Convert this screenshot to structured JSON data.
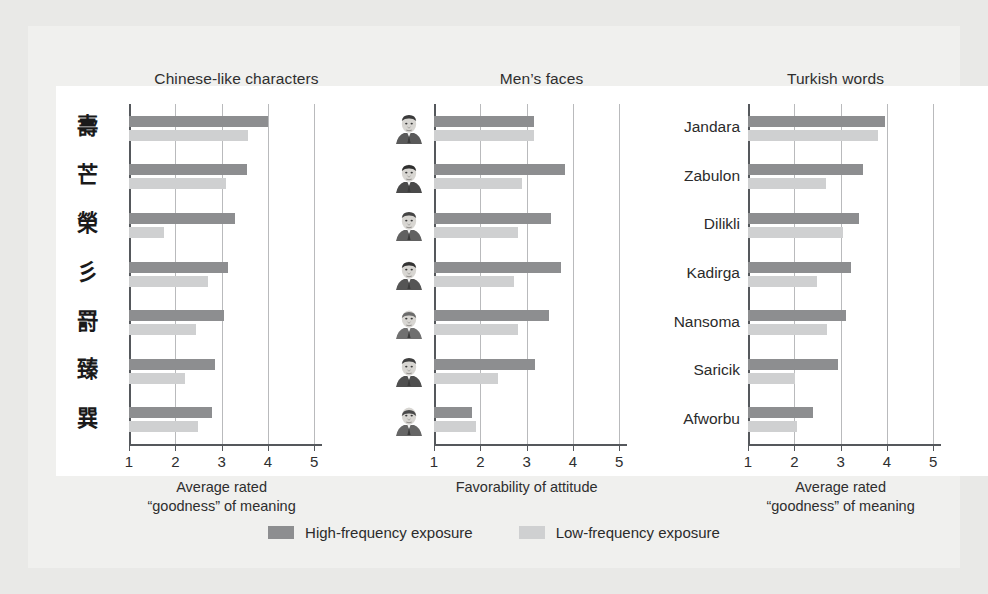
{
  "figure": {
    "background": "#e9e9e7",
    "card_background": "#ffffff",
    "colors": {
      "high_frequency": "#8d8e90",
      "low_frequency": "#cfd0d1",
      "axis": "#55585c",
      "gridline": "#b9babc",
      "text": "#2b2b2b"
    }
  },
  "legend": {
    "items": [
      {
        "label": "High-frequency exposure",
        "color": "#8d8e90",
        "key": "high"
      },
      {
        "label": "Low-frequency exposure",
        "color": "#cfd0d1",
        "key": "low"
      }
    ]
  },
  "chart_data": [
    {
      "type": "bar",
      "orientation": "horizontal",
      "title": "Chinese-like characters",
      "xlabel": "Average rated\n“goodness” of meaning",
      "ylabel": "",
      "xlim": [
        1,
        5
      ],
      "xticks": [
        1,
        2,
        3,
        4,
        5
      ],
      "ticklabels": [
        "1",
        "2",
        "3",
        "4",
        "5"
      ],
      "grid": true,
      "legend_position": "bottom",
      "category_type": "glyph",
      "categories": [
        "壽",
        "芒",
        "榮",
        "彡",
        "罸",
        "臻",
        "巽"
      ],
      "series": [
        {
          "name": "High-frequency exposure",
          "color": "#8d8e90",
          "values": [
            4.0,
            3.55,
            3.28,
            3.13,
            3.05,
            2.85,
            2.8
          ]
        },
        {
          "name": "Low-frequency exposure",
          "color": "#cfd0d1",
          "values": [
            3.57,
            3.1,
            1.75,
            2.7,
            2.45,
            2.2,
            2.5
          ]
        }
      ]
    },
    {
      "type": "bar",
      "orientation": "horizontal",
      "title": "Men’s faces",
      "xlabel": "Favorability of attitude",
      "ylabel": "",
      "xlim": [
        1,
        5
      ],
      "xticks": [
        1,
        2,
        3,
        4,
        5
      ],
      "ticklabels": [
        "1",
        "2",
        "3",
        "4",
        "5"
      ],
      "grid": true,
      "legend_position": "bottom",
      "category_type": "face",
      "categories": [
        "face-1",
        "face-2",
        "face-3",
        "face-4",
        "face-5",
        "face-6",
        "face-7"
      ],
      "series": [
        {
          "name": "High-frequency exposure",
          "color": "#8d8e90",
          "values": [
            3.15,
            3.82,
            3.53,
            3.75,
            3.48,
            3.18,
            1.82
          ]
        },
        {
          "name": "Low-frequency exposure",
          "color": "#cfd0d1",
          "values": [
            3.17,
            2.9,
            2.82,
            2.72,
            2.82,
            2.38,
            1.9
          ]
        }
      ]
    },
    {
      "type": "bar",
      "orientation": "horizontal",
      "title": "Turkish words",
      "xlabel": "Average rated\n“goodness” of meaning",
      "ylabel": "",
      "xlim": [
        1,
        5
      ],
      "xticks": [
        1,
        2,
        3,
        4,
        5
      ],
      "ticklabels": [
        "1",
        "2",
        "3",
        "4",
        "5"
      ],
      "grid": true,
      "legend_position": "bottom",
      "category_type": "text",
      "categories": [
        "Jandara",
        "Zabulon",
        "Dilikli",
        "Kadirga",
        "Nansoma",
        "Saricik",
        "Afworbu"
      ],
      "series": [
        {
          "name": "High-frequency exposure",
          "color": "#8d8e90",
          "values": [
            3.95,
            3.48,
            3.4,
            3.22,
            3.12,
            2.95,
            2.4
          ]
        },
        {
          "name": "Low-frequency exposure",
          "color": "#cfd0d1",
          "values": [
            3.8,
            2.68,
            3.05,
            2.48,
            2.7,
            2.02,
            2.05
          ]
        }
      ]
    }
  ]
}
